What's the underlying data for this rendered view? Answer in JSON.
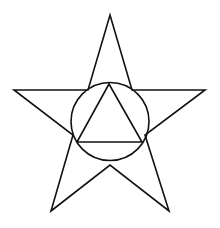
{
  "diagram": {
    "width": 220,
    "height": 228,
    "background": "#ffffff",
    "stroke_color": "#111111",
    "stroke_width": 1.6,
    "shapes": {
      "star": {
        "points": "110,15 132,90 205,90 145,135 169,211 110,165 51,211 73,135 14,90 88,90"
      },
      "circle": {
        "cx": 110,
        "cy": 121.5,
        "r": 39
      },
      "triangle": {
        "points": "109,84 77,142 142,142"
      }
    }
  }
}
